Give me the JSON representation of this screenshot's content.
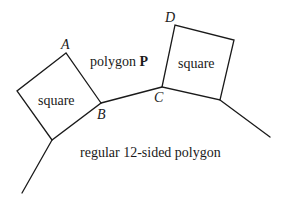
{
  "diagram": {
    "vertex_labels": {
      "A": "A",
      "B": "B",
      "C": "C",
      "D": "D"
    },
    "region_labels": {
      "left_square": "square",
      "right_square": "square",
      "polygon_p_prefix": "polygon ",
      "polygon_p_name": "P",
      "dodecagon": "regular 12-sided polygon"
    },
    "colors": {
      "stroke": "#1a1a1a",
      "background": "#ffffff"
    }
  }
}
